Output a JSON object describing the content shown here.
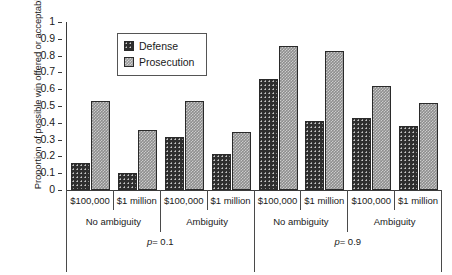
{
  "chart_data": {
    "type": "bar",
    "title": "",
    "xlabel": "",
    "ylabel": "Proportion of possible win offered or acceptable",
    "ylim": [
      0,
      1
    ],
    "yticks": [
      "0",
      "0.1",
      "0.2",
      "0.3",
      "0.4",
      "0.5",
      "0.6",
      "0.7",
      "0.8",
      "0.9",
      "1"
    ],
    "grid": false,
    "legend_position": "top-left-inside",
    "categories": [
      "p = 0.1 / No ambiguity / $100,000",
      "p = 0.1 / No ambiguity / $1 million",
      "p = 0.1 / Ambiguity / $100,000",
      "p = 0.1 / Ambiguity / $1 million",
      "p = 0.9 / No ambiguity / $100,000",
      "p = 0.9 / No ambiguity / $1 million",
      "p = 0.9 / Ambiguity / $100,000",
      "p = 0.9 / Ambiguity / $1 million"
    ],
    "series": [
      {
        "name": "Defense",
        "values": [
          0.16,
          0.1,
          0.315,
          0.215,
          0.66,
          0.41,
          0.43,
          0.38
        ]
      },
      {
        "name": "Prosecution",
        "values": [
          0.53,
          0.36,
          0.53,
          0.345,
          0.855,
          0.825,
          0.62,
          0.52
        ]
      }
    ],
    "axis_groups": {
      "amount_labels": [
        "$100,000",
        "$1 million",
        "$100,000",
        "$1 million",
        "$100,000",
        "$1 million",
        "$100,000",
        "$1 million"
      ],
      "ambiguity_labels": [
        "No ambiguity",
        "Ambiguity",
        "No ambiguity",
        "Ambiguity"
      ],
      "probability_labels": [
        "p = 0.1",
        "p = 0.9"
      ]
    }
  },
  "legend": {
    "entries": [
      {
        "label": "Defense",
        "swatch": "dark-dotted-swatch",
        "color": "#2e2e2e"
      },
      {
        "label": "Prosecution",
        "swatch": "gray-checkered-swatch",
        "color": "#8e8e8e"
      }
    ]
  },
  "colors": {
    "defense": "#2e2e2e",
    "prosecution": "#8e8e8e",
    "axis": "#3a3a3a",
    "background": "#ffffff"
  }
}
